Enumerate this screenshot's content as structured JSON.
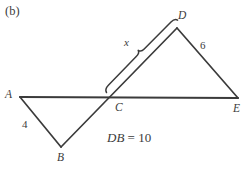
{
  "figure": {
    "panel_label": "(b)",
    "stroke_color": "#3b3b3b",
    "background_color": "#ffffff",
    "points": {
      "A": {
        "label": "A",
        "x": 20,
        "y": 97
      },
      "B": {
        "label": "B",
        "x": 61,
        "y": 147
      },
      "C": {
        "label": "C",
        "x": 112,
        "y": 98
      },
      "D": {
        "label": "D",
        "x": 177,
        "y": 28
      },
      "E": {
        "label": "E",
        "x": 238,
        "y": 98
      }
    },
    "measurements": {
      "ab_length": "4",
      "de_length": "6",
      "cd_unknown": "x",
      "db_equation": {
        "variable": "DB",
        "rest": "= 10"
      }
    }
  }
}
